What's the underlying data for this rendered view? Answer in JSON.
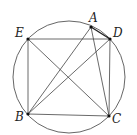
{
  "diagram": {
    "type": "geometry",
    "circle": {
      "cx": 69,
      "cy": 77,
      "r": 56
    },
    "points": {
      "A": {
        "label": "A",
        "x": 91,
        "y": 27
      },
      "B": {
        "label": "B",
        "x": 28,
        "y": 114
      },
      "C": {
        "label": "C",
        "x": 109,
        "y": 116
      },
      "D": {
        "label": "D",
        "x": 110,
        "y": 39
      },
      "E": {
        "label": "E",
        "x": 28,
        "y": 39
      }
    },
    "segments": [
      "E-D",
      "E-B",
      "E-C",
      "B-C",
      "B-A",
      "B-D",
      "A-C",
      "D-C",
      "A-D"
    ],
    "labels": {
      "A": "A",
      "B": "B",
      "C": "C",
      "D": "D",
      "E": "E"
    }
  }
}
